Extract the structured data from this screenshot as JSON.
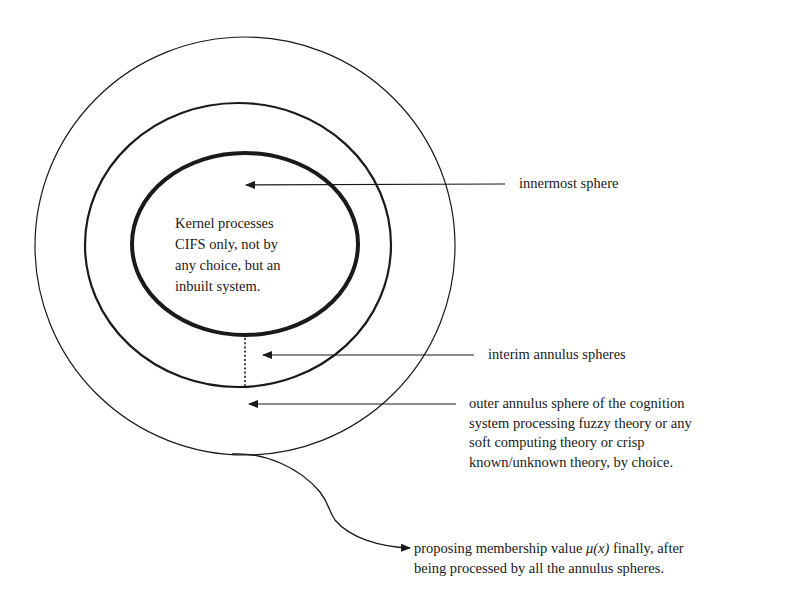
{
  "diagram": {
    "type": "concentric-spheres",
    "spheres": [
      {
        "id": "outer",
        "name": "outer annulus sphere",
        "cx": 245,
        "cy": 246,
        "rx": 210,
        "ry": 209,
        "stroke_width": 1.2
      },
      {
        "id": "middle",
        "name": "interim annulus sphere",
        "cx": 238,
        "cy": 245,
        "rx": 153,
        "ry": 142,
        "stroke_width": 2.2
      },
      {
        "id": "inner",
        "name": "innermost sphere",
        "cx": 245,
        "cy": 244,
        "rx": 113,
        "ry": 91,
        "stroke_width": 4
      }
    ],
    "colors": {
      "stroke": "#1a1a1a",
      "background": "#ffffff"
    }
  },
  "kernel": {
    "lines": [
      "Kernel  processes",
      "CIFS only, not by",
      "any choice, but  an",
      "inbuilt system."
    ]
  },
  "labels": {
    "innermost": "innermost sphere",
    "interim": "interim annulus spheres",
    "outer": [
      "outer annulus sphere of the cognition",
      "system processing fuzzy theory or any",
      "soft computing theory or crisp",
      "known/unknown theory, by choice."
    ],
    "final": {
      "line1_prefix": "proposing membership value ",
      "mu_symbol": "μ(x)",
      "line1_suffix": " finally, after",
      "line2": "being processed by all the annulus spheres."
    }
  },
  "arrows": [
    {
      "id": "innermost-arrow",
      "from": [
        505,
        184
      ],
      "to": [
        245,
        185
      ]
    },
    {
      "id": "interim-arrow",
      "from": [
        474,
        355
      ],
      "to": [
        262,
        355
      ]
    },
    {
      "id": "outer-arrow",
      "from": [
        456,
        404
      ],
      "to": [
        248,
        404
      ]
    },
    {
      "id": "membership-arrow",
      "type": "curve",
      "from": [
        250,
        454
      ],
      "to": [
        410,
        548
      ]
    }
  ]
}
